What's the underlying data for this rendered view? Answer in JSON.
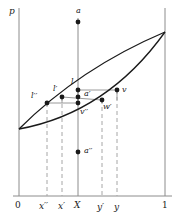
{
  "figure": {
    "type": "math-diagram",
    "axis": {
      "vertical_label": "p",
      "x_ticks": [
        {
          "key": "origin",
          "label": "0",
          "x": 19
        },
        {
          "key": "xpp",
          "label": "x′′",
          "x": 47
        },
        {
          "key": "xp",
          "label": "x′",
          "x": 62
        },
        {
          "key": "X",
          "label": "X",
          "x": 78
        },
        {
          "key": "yp",
          "label": "y′",
          "x": 102
        },
        {
          "key": "y",
          "label": "y",
          "x": 117
        },
        {
          "key": "one",
          "label": "1",
          "x": 165
        }
      ]
    },
    "points": [
      {
        "key": "a",
        "label": "a",
        "x": 78,
        "y": 22,
        "lx": 76,
        "ly": 7
      },
      {
        "key": "l",
        "label": "l",
        "x": 78,
        "y": 90,
        "lx": 71,
        "ly": 78
      },
      {
        "key": "lp",
        "label": "l′",
        "x": 62,
        "y": 97,
        "lx": 53,
        "ly": 85
      },
      {
        "key": "lpp",
        "label": "l′′",
        "x": 47,
        "y": 103,
        "lx": 32,
        "ly": 92
      },
      {
        "key": "ap",
        "label": "a′",
        "x": 78,
        "y": 97,
        "lx": 84,
        "ly": 91
      },
      {
        "key": "v",
        "label": "v",
        "x": 117,
        "y": 90,
        "lx": 122,
        "ly": 87
      },
      {
        "key": "wp",
        "label": "w′",
        "x": 102,
        "y": 100,
        "lx": 103,
        "ly": 103
      },
      {
        "key": "vpp",
        "label": "v′′",
        "x": 78,
        "y": 103,
        "lx": 80,
        "ly": 109
      },
      {
        "key": "app",
        "label": "a′′",
        "x": 78,
        "y": 152,
        "lx": 84,
        "ly": 148
      }
    ],
    "colors": {
      "ink": "#1a1a1a",
      "axis": "#8c8c8c",
      "guide": "#a6a6a6",
      "connector": "#9a9a9a"
    },
    "lens": {
      "left_apex": {
        "x": 19,
        "y": 129
      },
      "right_apex": {
        "x": 165,
        "y": 32
      },
      "upper_curve_note": "chord bowing upward",
      "lower_curve_note": "chord bowing downward"
    }
  }
}
